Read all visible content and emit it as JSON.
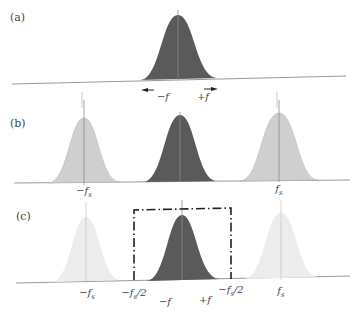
{
  "panels": [
    {
      "id": "a",
      "label": "(a)",
      "annotations": {
        "minus_f": "−f",
        "plus_f": "+f"
      }
    },
    {
      "id": "b",
      "label": "(b)",
      "annotations": {
        "minus_fs": "−f",
        "minus_fs_sub": "s",
        "fs": "f",
        "fs_sub": "s"
      }
    },
    {
      "id": "c",
      "label": "(c)",
      "annotations": {
        "minus_fs": "−f",
        "minus_fs_sub": "s",
        "fs": "f",
        "fs_sub": "s",
        "left_edge": "−f",
        "left_edge_sub": "s",
        "left_edge_tail": "/2",
        "right_edge": "−f",
        "right_edge_sub": "s",
        "right_edge_tail": "/2",
        "minus_f": "−f",
        "plus_f": "+f"
      }
    }
  ],
  "colors": {
    "baseband": "#5a5a5a",
    "image_b": "#cfcfcf",
    "image_c": "#ececec",
    "axis": "#9a9a9a",
    "box": "#222222"
  }
}
